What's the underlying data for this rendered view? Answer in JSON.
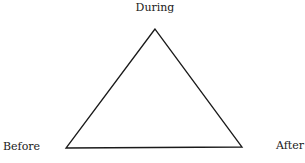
{
  "diagram": {
    "type": "triangle",
    "stroke_color": "#1a1a1a",
    "background": "#ffffff",
    "vertices": {
      "top": {
        "label": "During",
        "x": 155,
        "y": 29
      },
      "bottom_left": {
        "label": "Before",
        "x": 66,
        "y": 148
      },
      "bottom_right": {
        "label": "After",
        "x": 242,
        "y": 147
      }
    }
  }
}
